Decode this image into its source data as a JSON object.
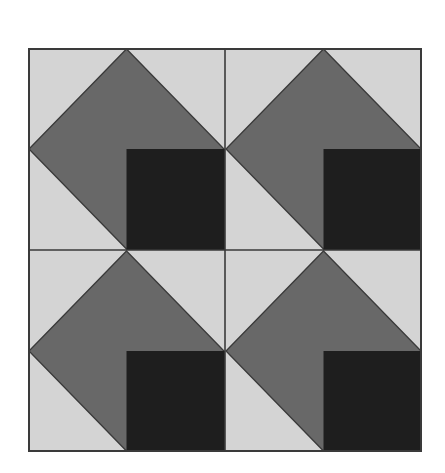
{
  "title": "Quilt block pattern (2x2)",
  "grid": {
    "rows": 2,
    "cols": 2
  },
  "colors": {
    "background": "#ffffff",
    "light": "#d4d4d4",
    "medium": "#686868",
    "dark": "#1e1e1e",
    "line": "#3a3a3a"
  },
  "blocks": [
    {
      "row": 0,
      "col": 0,
      "shapes": [
        "light-background",
        "medium-diamond",
        "dark-square-bottom-right"
      ]
    },
    {
      "row": 0,
      "col": 1,
      "shapes": [
        "light-background",
        "medium-diamond",
        "dark-square-bottom-right"
      ]
    },
    {
      "row": 1,
      "col": 0,
      "shapes": [
        "light-background",
        "medium-diamond",
        "dark-square-bottom-right"
      ]
    },
    {
      "row": 1,
      "col": 1,
      "shapes": [
        "light-background",
        "medium-diamond",
        "dark-square-bottom-right"
      ]
    }
  ]
}
